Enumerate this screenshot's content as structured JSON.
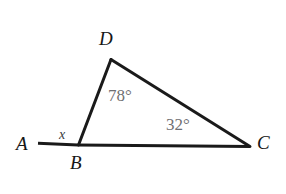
{
  "figure": {
    "type": "geometry-diagram",
    "background_color": "#ffffff",
    "stroke_color": "#1a1a1a",
    "label_color": "#161616",
    "angle_label_color": "#6f6f72",
    "variable_label_color": "#3a3a3e",
    "vertices": [
      {
        "name": "A",
        "label": "A",
        "x": 38,
        "y": 143
      },
      {
        "name": "B",
        "label": "B",
        "x": 78,
        "y": 145
      },
      {
        "name": "C",
        "label": "C",
        "x": 250,
        "y": 146
      },
      {
        "name": "D",
        "label": "D",
        "x": 111,
        "y": 59
      }
    ],
    "segments": [
      {
        "name": "segment-AB",
        "from": "A",
        "to": "B",
        "width": 3
      },
      {
        "name": "segment-BC",
        "from": "B",
        "to": "C",
        "width": 3
      },
      {
        "name": "segment-BD",
        "from": "B",
        "to": "D",
        "width": 3
      },
      {
        "name": "segment-DC",
        "from": "D",
        "to": "C",
        "width": 3
      }
    ],
    "angles": [
      {
        "name": "angle-at-D",
        "vertex": "D",
        "label": "78°",
        "value": 78,
        "unit": "degrees"
      },
      {
        "name": "angle-at-C",
        "vertex": "C",
        "label": "32°",
        "value": 32,
        "unit": "degrees"
      },
      {
        "name": "angle-at-B-exterior",
        "vertex": "B",
        "label": "x",
        "value": null,
        "unit": "unknown"
      }
    ]
  },
  "labels": {
    "vertex_a": "A",
    "vertex_b": "B",
    "vertex_c": "C",
    "vertex_d": "D",
    "angle_d": "78°",
    "angle_c": "32°",
    "unknown_angle": "x"
  }
}
